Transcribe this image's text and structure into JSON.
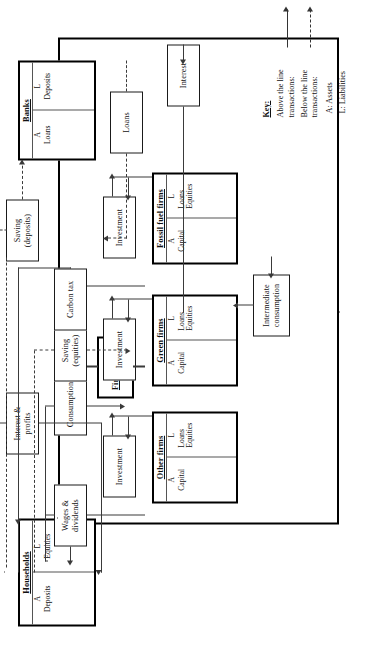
{
  "figure": {
    "orientation": "rotated-90-ccw"
  },
  "accounts": {
    "households": {
      "title": "Households",
      "assets_header": "A",
      "liabilities_header": "L",
      "assets_items": "Deposits",
      "liabilities_items": "Equities"
    },
    "banks": {
      "title": "Banks",
      "assets_header": "A",
      "liabilities_header": "L",
      "assets_items": "Loans",
      "liabilities_items": "Deposits"
    },
    "other_firms": {
      "title": "Other firms",
      "assets_header": "A",
      "liabilities_header": "L",
      "assets_items": "Capital",
      "liabilities_items": "Loans\nEquities"
    },
    "green_firms": {
      "title": "Green firms",
      "assets_header": "A",
      "liabilities_header": "L",
      "assets_items": "Capital",
      "liabilities_items": "Loans\nEquities"
    },
    "fossil_fuel_firms": {
      "title": "Fossil fuel firms",
      "assets_header": "A",
      "liabilities_header": "L",
      "assets_items": "Capital",
      "liabilities_items": "Loans\nEquities"
    }
  },
  "group_label": {
    "firm_sectors": "Firm sectors"
  },
  "flows": {
    "wages_dividends": "Wages &\ndividends",
    "consumption": "Consumption",
    "saving_equities": "Saving\n(equities)",
    "carbon_tax": "Carbon tax",
    "interest_profits": "Interest &\nprofits",
    "saving_deposits": "Saving\n(deposits)",
    "loans": "Loans",
    "interest": "Interest",
    "investment_other": "Investment",
    "investment_green": "Investment",
    "investment_fossil": "Investment",
    "intermediate_consumption": "Intermediate\nconsumption"
  },
  "key": {
    "title": "Key:",
    "above_label": "Above the line\ntransactions:",
    "below_label": "Below the line\ntransactions:",
    "assets_def": "A: Assets",
    "liabilities_def": "L: Liabilities"
  },
  "colors": {
    "line": "#3a3a3a",
    "border": "#1a1a1a",
    "background": "#ffffff"
  }
}
